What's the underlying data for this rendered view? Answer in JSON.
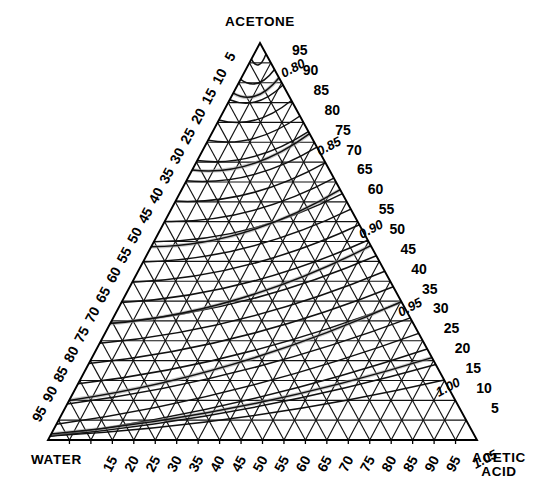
{
  "figure": {
    "type": "ternary-phase-diagram",
    "background_color": "#ffffff",
    "line_color": "#111111"
  },
  "corners": {
    "top": "ACETONE",
    "bottom_left": "WATER",
    "bottom_right_line1": "ACETIC",
    "bottom_right_line2": "ACID"
  },
  "chart_data": {
    "type": "line",
    "title": "ACETONE",
    "xlabel": "WATER",
    "ylabel": "ACETIC ACID",
    "grid": true,
    "legend": "none",
    "components": [
      "ACETONE",
      "WATER",
      "ACETIC ACID"
    ],
    "axis_ranges": {
      "acetone": [
        0,
        100
      ],
      "water": [
        0,
        100
      ],
      "acetic_acid": [
        0,
        100
      ]
    },
    "tick_step": 5,
    "left_axis_ticks": [
      "5",
      "10",
      "15",
      "20",
      "25",
      "30",
      "35",
      "40",
      "45",
      "50",
      "55",
      "60",
      "65",
      "70",
      "75",
      "80",
      "85",
      "90",
      "95"
    ],
    "right_axis_ticks": [
      "95",
      "90",
      "85",
      "80",
      "75",
      "70",
      "65",
      "60",
      "55",
      "50",
      "45",
      "40",
      "35",
      "30",
      "25",
      "20",
      "15",
      "10",
      "5"
    ],
    "bottom_axis_ticks": [
      "15",
      "20",
      "25",
      "30",
      "35",
      "40",
      "45",
      "50",
      "55",
      "60",
      "65",
      "70",
      "75",
      "80",
      "85",
      "90",
      "95"
    ],
    "density_curves": [
      {
        "label": "0.80",
        "value": 0.8,
        "label_x": 295,
        "label_y": 72
      },
      {
        "label": "0.85",
        "value": 0.85,
        "label_x": 331,
        "label_y": 150
      },
      {
        "label": "0.90",
        "value": 0.9,
        "label_x": 373,
        "label_y": 233
      },
      {
        "label": "0.95",
        "value": 0.95,
        "label_x": 412,
        "label_y": 311
      },
      {
        "label": "1.00",
        "value": 1.0,
        "label_x": 450,
        "label_y": 391
      },
      {
        "label": "1.05",
        "value": 1.05,
        "label_x": 487,
        "label_y": 463
      }
    ],
    "density_series_note": "iso-density contour lines spanning the triangle",
    "density_units": "g/cm3"
  },
  "geometry": {
    "apex_x": 260,
    "apex_y": 43,
    "left_x": 48,
    "left_y": 440,
    "right_x": 477,
    "right_y": 440
  }
}
